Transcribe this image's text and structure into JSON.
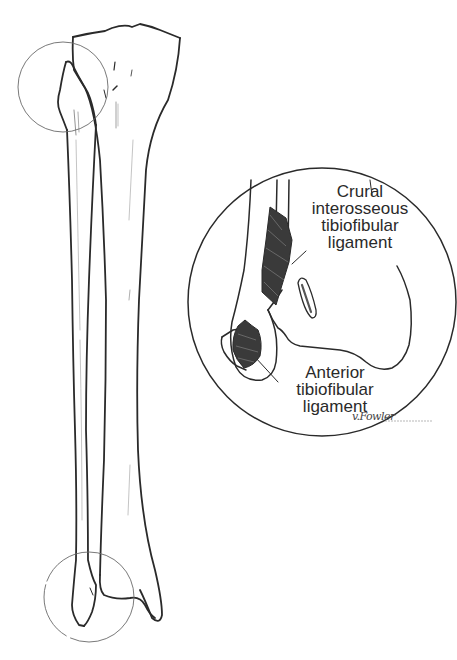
{
  "figure": {
    "ink_color": "#2a2a2a",
    "circle_color": "#6a6a6a",
    "ligament_fill": "#3a3a3a"
  },
  "labels": {
    "crural": {
      "line1": "Crural",
      "line2": "interosseous",
      "line3": "tibiofibular",
      "line4": "ligament"
    },
    "anterior": {
      "line1": "Anterior",
      "line2": "tibiofibular",
      "line3": "ligament"
    }
  },
  "signature": "v.Fowler"
}
